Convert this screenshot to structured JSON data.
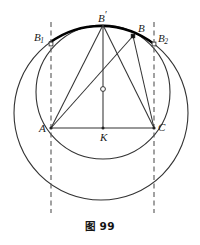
{
  "figure": {
    "caption": "图 99",
    "stroke_color": "#333333",
    "dash_color": "#555555",
    "accent_arc_color": "#000000",
    "background": "#ffffff"
  },
  "labels": {
    "A": "A",
    "C": "C",
    "K": "K",
    "B": "B",
    "B_prime_base": "B",
    "B_prime_mark": "′",
    "B1_base": "B",
    "B1_sub": "1",
    "B2_base": "B",
    "B2_sub": "2"
  },
  "geometry": {
    "outer_circle": {
      "cx": 101,
      "cy": 113,
      "r": 87
    },
    "inner_circle": {
      "cx": 103,
      "cy": 92,
      "r": 67
    },
    "points": {
      "A": {
        "x": 51,
        "y": 128
      },
      "C": {
        "x": 154,
        "y": 128
      },
      "K": {
        "x": 103,
        "y": 128
      },
      "B_prime": {
        "x": 103,
        "y": 25
      },
      "B": {
        "x": 133,
        "y": 36
      },
      "B1": {
        "x": 51,
        "y": 44
      },
      "B2": {
        "x": 154,
        "y": 44
      },
      "center_O": {
        "x": 103,
        "y": 89
      }
    },
    "dashed_lines": [
      {
        "x": 51,
        "y1": 22,
        "y2": 213
      },
      {
        "x": 154,
        "y1": 22,
        "y2": 213
      }
    ],
    "segments": [
      {
        "from": "A",
        "to": "C",
        "name": "base-AC"
      },
      {
        "from": "A",
        "to": "B_prime",
        "name": "side-A-Bprime"
      },
      {
        "from": "C",
        "to": "B_prime",
        "name": "side-C-Bprime"
      },
      {
        "from": "A",
        "to": "B",
        "name": "side-A-B"
      },
      {
        "from": "C",
        "to": "B",
        "name": "side-C-B"
      },
      {
        "from": "B_prime",
        "to": "K",
        "name": "altitude-Bprime-K"
      }
    ],
    "highlight_arc": {
      "description": "bold arc on outer circle from B1 through B-prime to B2",
      "from": "B1",
      "to": "B2",
      "via": "B_prime"
    }
  }
}
